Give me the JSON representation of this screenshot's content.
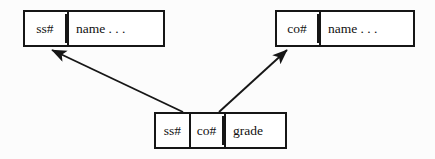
{
  "diagram": {
    "background_color": "#fcfcfc",
    "line_color": "#161616",
    "box_fill_color": "#ffffff",
    "relations": [
      {
        "id": "student",
        "name": "student-relation",
        "position": {
          "x": 23,
          "y": 10,
          "width": 142,
          "height": 37
        },
        "fields": [
          {
            "label": "ss#",
            "role": "key",
            "separator": "none"
          },
          {
            "label": "name . . .",
            "role": "attributes",
            "separator": "double"
          }
        ]
      },
      {
        "id": "course",
        "name": "course-relation",
        "position": {
          "x": 275,
          "y": 10,
          "width": 140,
          "height": 37
        },
        "fields": [
          {
            "label": "co#",
            "role": "key",
            "separator": "none"
          },
          {
            "label": "name . . .",
            "role": "attributes",
            "separator": "double"
          }
        ]
      },
      {
        "id": "enroll",
        "name": "enrollment-relation",
        "position": {
          "x": 154,
          "y": 112,
          "width": 133,
          "height": 37
        },
        "fields": [
          {
            "label": "ss#",
            "role": "key-part",
            "separator": "none"
          },
          {
            "label": "co#",
            "role": "key-part",
            "separator": "single"
          },
          {
            "label": "grade",
            "role": "attributes",
            "separator": "double"
          }
        ]
      }
    ],
    "arrows": [
      {
        "id": "ss-ref",
        "name": "foreign-key-arrow-ss",
        "from_field": "ss#",
        "from_relation": "enroll",
        "to_field": "ss#",
        "to_relation": "student",
        "tail": {
          "x": 183,
          "y": 112
        },
        "head": {
          "x": 50,
          "y": 49
        }
      },
      {
        "id": "co-ref",
        "name": "foreign-key-arrow-co",
        "from_field": "co#",
        "from_relation": "enroll",
        "to_field": "co#",
        "to_relation": "course",
        "tail": {
          "x": 219,
          "y": 112
        },
        "head": {
          "x": 289,
          "y": 49
        }
      }
    ]
  }
}
